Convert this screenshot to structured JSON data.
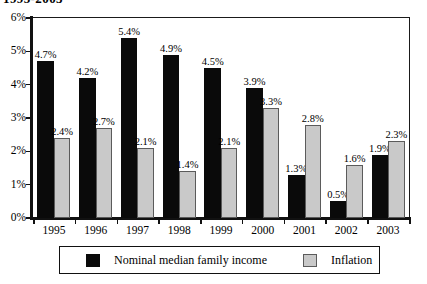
{
  "chart_data": {
    "type": "bar",
    "title": "1995-2003",
    "xlabel": "",
    "ylabel": "",
    "ylim": [
      0,
      6
    ],
    "ytick_labels": [
      "0%",
      "1%",
      "2%",
      "3%",
      "4%",
      "5%",
      "6%"
    ],
    "ytick_values": [
      0,
      1,
      2,
      3,
      4,
      5,
      6
    ],
    "grid": false,
    "legend_position": "bottom",
    "categories": [
      "1995",
      "1996",
      "1997",
      "1998",
      "1999",
      "2000",
      "2001",
      "2002",
      "2003"
    ],
    "series": [
      {
        "name": "Nominal median family income",
        "color": "#0a0a0a",
        "values": [
          4.7,
          4.2,
          5.4,
          4.9,
          4.5,
          3.9,
          1.3,
          0.5,
          1.9
        ],
        "labels": [
          "4.7%",
          "4.2%",
          "5.4%",
          "4.9%",
          "4.5%",
          "3.9%",
          "1.3%",
          "0.5%",
          "1.9%"
        ]
      },
      {
        "name": "Inflation",
        "color": "#c9c9c9",
        "values": [
          2.4,
          2.7,
          2.1,
          1.4,
          2.1,
          3.3,
          2.8,
          1.6,
          2.3
        ],
        "labels": [
          "2.4%",
          "2.7%",
          "2.1%",
          "1.4%",
          "2.1%",
          "3.3%",
          "2.8%",
          "1.6%",
          "2.3%"
        ]
      }
    ]
  },
  "legend": {
    "entries": [
      {
        "label": "Nominal median family income",
        "swatch": "black"
      },
      {
        "label": "Inflation",
        "swatch": "gray"
      }
    ]
  }
}
